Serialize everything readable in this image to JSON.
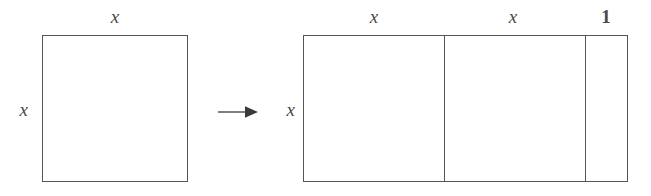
{
  "figure": {
    "background_color": "#ffffff",
    "line_color": "#555555",
    "text_color": "#4a4a4a"
  },
  "left_shape": {
    "name": "square",
    "top_label": "x",
    "side_label": "x",
    "x": 42,
    "y": 35,
    "width": 146,
    "height": 147
  },
  "arrow": {
    "glyph": "right-arrow",
    "x": 218,
    "y": 112,
    "length": 37
  },
  "right_shape": {
    "name": "partitioned-rectangle",
    "side_label": "x",
    "x": 303,
    "y": 35,
    "width": 325,
    "height": 147,
    "segments": [
      {
        "label": "x",
        "start": 303,
        "end": 444,
        "label_x": 374
      },
      {
        "label": "x",
        "start": 444,
        "end": 585,
        "label_x": 513
      },
      {
        "label": "1",
        "start": 585,
        "end": 628,
        "label_x": 606
      }
    ],
    "divider_positions": [
      444,
      585
    ]
  }
}
